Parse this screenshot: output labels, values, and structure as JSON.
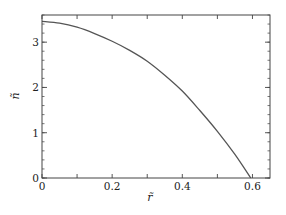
{
  "chart_data": {
    "type": "line",
    "title": "",
    "xlabel": "r̃",
    "ylabel": "ñ",
    "xlim": [
      0,
      0.65
    ],
    "ylim": [
      0,
      3.6
    ],
    "xticks": [
      0,
      0.2,
      0.4,
      0.6
    ],
    "xtick_labels": [
      "0",
      "0.2",
      "0.4",
      "0.6"
    ],
    "xminor_step": 0.1,
    "yticks": [
      0,
      1,
      2,
      3
    ],
    "ytick_labels": [
      "0",
      "1",
      "2",
      "3"
    ],
    "yminor_step": 0.2,
    "grid": false,
    "legend": null,
    "series": [
      {
        "name": "n(r)",
        "color": "#555555",
        "x": [
          0,
          0.05,
          0.1,
          0.15,
          0.2,
          0.25,
          0.3,
          0.35,
          0.4,
          0.45,
          0.5,
          0.55,
          0.595
        ],
        "y": [
          3.46,
          3.42,
          3.33,
          3.19,
          3.02,
          2.82,
          2.58,
          2.27,
          1.92,
          1.49,
          1.03,
          0.52,
          0.0
        ]
      }
    ]
  }
}
